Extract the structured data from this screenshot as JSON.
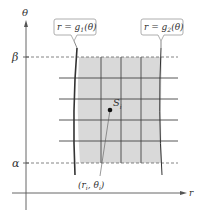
{
  "figure": {
    "axes": {
      "vertical_label": "θ",
      "horizontal_label": "r",
      "beta_label": "β",
      "alpha_label": "α"
    },
    "callouts": {
      "left": {
        "prefix": "r = g",
        "sub": "1",
        "suffix": "(θ)"
      },
      "right": {
        "prefix": "r = g",
        "sub": "2",
        "suffix": "(θ)"
      }
    },
    "point": {
      "region_label": "S",
      "region_sub": "i",
      "coord_label_open": "(r",
      "coord_label_sub1": "i",
      "coord_label_mid": ", θ",
      "coord_label_sub2": "i",
      "coord_label_close": ")"
    },
    "colors": {
      "shade": "#d9d9d9",
      "line": "#333333",
      "callout_border": "#999999"
    }
  }
}
